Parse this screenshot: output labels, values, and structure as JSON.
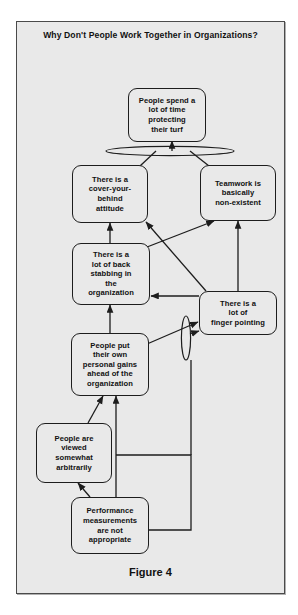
{
  "figure": {
    "title": "Why Don't People Work\nTogether in\nOrganizations?",
    "caption": "Figure 4",
    "background_color": "#e9e9e9",
    "border_color": "#4a4a4a",
    "node_border_color": "#1d1d1d",
    "text_color": "#111111"
  },
  "nodes": [
    {
      "id": "turf",
      "label": "People spend a\nlot of time\nprotecting\ntheir turf"
    },
    {
      "id": "cover",
      "label": "There is a\ncover-your-\nbehind\nattitude"
    },
    {
      "id": "teamwork",
      "label": "Teamwork is\nbasically\nnon-existent"
    },
    {
      "id": "backstab",
      "label": "There is a\nlot of back\nstabbing in\nthe\norganization"
    },
    {
      "id": "finger",
      "label": "There is a\nlot of\nfinger pointing"
    },
    {
      "id": "personal",
      "label": "People put\ntheir own\npersonal gains\nahead of the\norganization"
    },
    {
      "id": "arbitrary",
      "label": "People are\nviewed\nsomewhat\narbitrarily"
    },
    {
      "id": "performance",
      "label": "Performance\nmeasurements\nare not\nappropriate"
    }
  ],
  "connectors": [
    {
      "id": "and-top",
      "type": "ellipse-and",
      "orientation": "horizontal"
    },
    {
      "id": "and-finger",
      "type": "ellipse-and",
      "orientation": "vertical"
    }
  ],
  "edges": [
    {
      "from": "cover",
      "to": "turf"
    },
    {
      "from": "teamwork",
      "to": "turf"
    },
    {
      "from": "backstab",
      "to": "cover"
    },
    {
      "from": "backstab",
      "to": "teamwork"
    },
    {
      "from": "finger",
      "to": "cover"
    },
    {
      "from": "finger",
      "to": "teamwork"
    },
    {
      "from": "finger",
      "to": "backstab"
    },
    {
      "from": "personal",
      "to": "backstab"
    },
    {
      "from": "personal",
      "to": "finger"
    },
    {
      "from": "arbitrary",
      "to": "personal"
    },
    {
      "from": "performance",
      "to": "arbitrary"
    },
    {
      "from": "performance",
      "to": "personal"
    },
    {
      "from": "performance",
      "to": "finger"
    }
  ]
}
